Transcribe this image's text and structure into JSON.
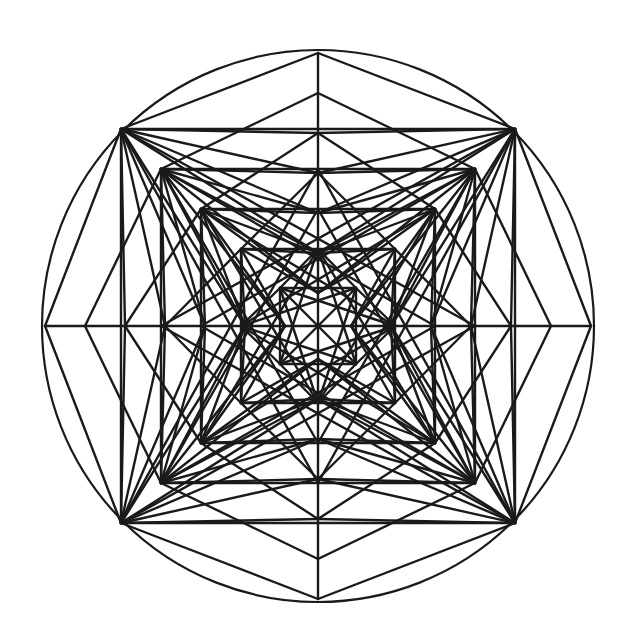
{
  "diagram": {
    "title": "",
    "style": {
      "stroke_color": "#1a1a1a",
      "background": "#ffffff"
    },
    "structure": {
      "outer_shape": "circle",
      "nested_square_count": 4,
      "star_points": 8,
      "axis_tip_levels": 6,
      "fan_levels_per_corner": 4,
      "inner_core": "small square with diagonal fan"
    }
  }
}
